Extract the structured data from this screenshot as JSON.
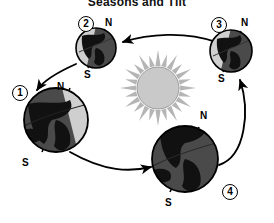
{
  "diagram": {
    "title": "Seasons and Tilt",
    "type": "earth-orbit-seasons",
    "background_color": "#ffffff",
    "sun": {
      "label": "sun",
      "center": [
        158,
        88
      ],
      "core_radius": 20,
      "ray_count": 24,
      "core_color": "#c9c9c9",
      "ray_color": "#b5b5b5"
    },
    "orbit": {
      "direction": "counterclockwise",
      "arrow_color": "#000000",
      "arrows": [
        {
          "name": "arrow-3-to-2",
          "from": "position-3",
          "to": "position-2",
          "points": "top"
        },
        {
          "name": "arrow-2-to-1",
          "from": "position-2",
          "to": "position-1",
          "points": "lower-left"
        },
        {
          "name": "arrow-1-to-4",
          "from": "position-1",
          "to": "position-4",
          "points": "right"
        },
        {
          "name": "arrow-4-to-3",
          "from": "position-4",
          "to": "position-3",
          "points": "up"
        }
      ]
    },
    "positions": [
      {
        "id": "position-1",
        "number": "1",
        "north_label": "N",
        "south_label": "S",
        "cx": 56,
        "cy": 120,
        "r": 32,
        "tilt_deg": 23,
        "lit_side": "right",
        "size": "large"
      },
      {
        "id": "position-2",
        "number": "2",
        "north_label": "N",
        "south_label": "S",
        "cx": 96,
        "cy": 48,
        "r": 20,
        "tilt_deg": 23,
        "lit_side": "left",
        "size": "small"
      },
      {
        "id": "position-3",
        "number": "3",
        "north_label": "N",
        "south_label": "S",
        "cx": 231,
        "cy": 51,
        "r": 21,
        "tilt_deg": 23,
        "lit_side": "left",
        "size": "small"
      },
      {
        "id": "position-4",
        "number": "4",
        "north_label": "N",
        "south_label": "S",
        "cx": 185,
        "cy": 159,
        "r": 33,
        "tilt_deg": 23,
        "lit_side": "left",
        "size": "large"
      }
    ],
    "colors": {
      "globe_dark": "#4a4a4a",
      "globe_light": "#cfcfcf",
      "landmass": "#111111",
      "outline": "#000000"
    }
  }
}
